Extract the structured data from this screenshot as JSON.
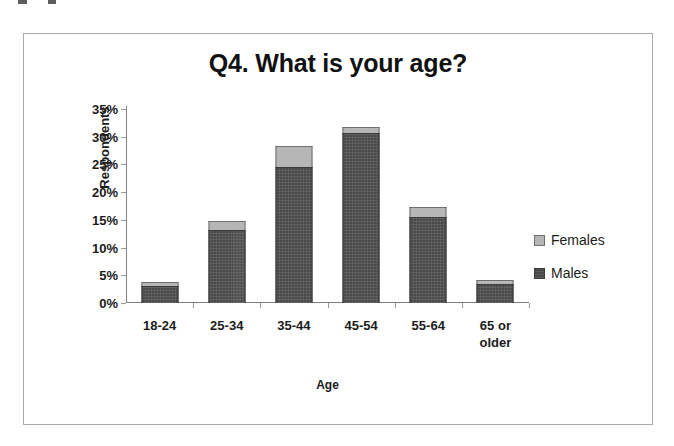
{
  "chart_data": {
    "type": "bar",
    "subtype": "stacked-bar",
    "title": "Q4. What is your age?",
    "xlabel": "Age",
    "ylabel": "Respondents",
    "categories": [
      "18-24",
      "25-34",
      "35-44",
      "45-54",
      "55-64",
      "65 or\nolder"
    ],
    "series": [
      {
        "name": "Males",
        "values": [
          3.0,
          13.2,
          24.5,
          30.7,
          15.6,
          3.4
        ],
        "color": "#4a4a4a"
      },
      {
        "name": "Females",
        "values": [
          0.8,
          1.6,
          3.8,
          1.1,
          1.7,
          0.7
        ],
        "color": "#b6b6b6"
      }
    ],
    "totals": [
      3.8,
      14.8,
      28.3,
      31.8,
      17.3,
      4.1
    ],
    "ylim": [
      0,
      35
    ],
    "yticks": [
      "0%",
      "5%",
      "10%",
      "15%",
      "20%",
      "25%",
      "30%",
      "35%"
    ],
    "ytick_values": [
      0,
      5,
      10,
      15,
      20,
      25,
      30,
      35
    ],
    "grid": false,
    "legend_position": "right",
    "legend": [
      "Females",
      "Males"
    ],
    "value_suffix": "%"
  },
  "colors": {
    "males": "#4a4a4a",
    "females": "#b6b6b6",
    "axis": "#808080",
    "frame": "#a9a9a9",
    "text": "#1b1b1b"
  }
}
